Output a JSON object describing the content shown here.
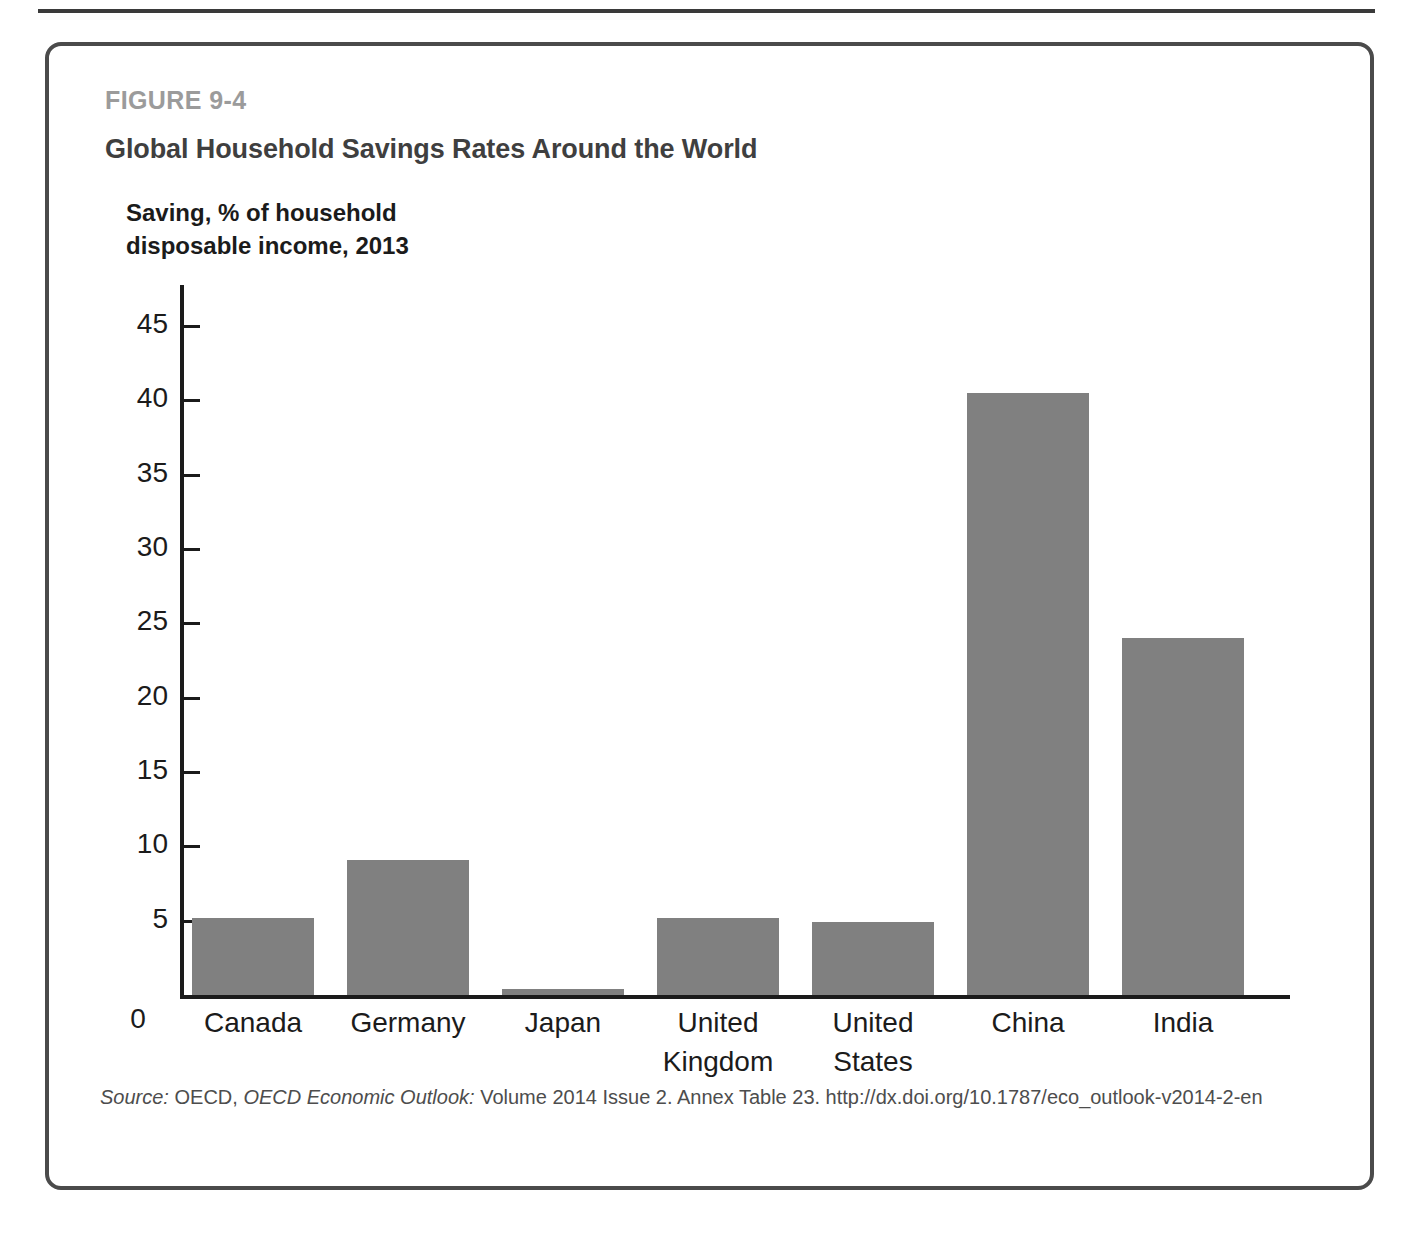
{
  "figure": {
    "label": "FIGURE 9-4",
    "title": "Global Household Savings Rates Around the World",
    "axis_caption": "Saving, % of household\ndisposable income, 2013"
  },
  "source": {
    "prefix": "Source:",
    "publisher": "OECD,",
    "publication": "OECD Economic Outlook:",
    "details": "Volume 2014 Issue 2. Annex Table 23. http://dx.doi.org/10.1787/eco_outlook-v2014-2-en"
  },
  "colors": {
    "bar_fill": "#808080",
    "axis": "#1b1b1b",
    "figure_label": "#9b9b9b",
    "title": "#3f3f3f",
    "box_border": "#4b4b4b"
  },
  "chart_data": {
    "type": "bar",
    "title": "Global Household Savings Rates Around the World",
    "subtitle": "Saving, % of household disposable income, 2013",
    "xlabel": "",
    "ylabel": "Saving, % of household disposable income, 2013",
    "categories": [
      "Canada",
      "Germany",
      "Japan",
      "United Kingdom",
      "United States",
      "China",
      "India"
    ],
    "values": [
      5.2,
      9.1,
      0.4,
      5.2,
      4.9,
      40.5,
      24.0
    ],
    "ylim": [
      0,
      47
    ],
    "yticks": [
      0,
      5,
      10,
      15,
      20,
      25,
      30,
      35,
      40,
      45
    ],
    "ytick_labels": [
      "0",
      "5",
      "10",
      "15",
      "20",
      "25",
      "30",
      "35",
      "40",
      "45"
    ],
    "grid": false,
    "legend": "none",
    "series": [
      {
        "name": "Saving, % of household disposable income, 2013",
        "values": [
          5.2,
          9.1,
          0.4,
          5.2,
          4.9,
          40.5,
          24.0
        ]
      }
    ]
  }
}
